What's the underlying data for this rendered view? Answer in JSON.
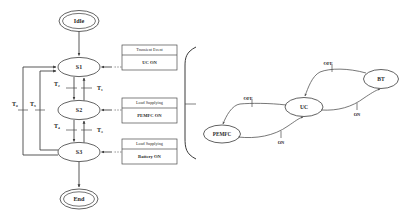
{
  "figure": {
    "colors": {
      "stroke": "#3a3a3a",
      "text": "#2b2b2b",
      "background": "#ffffff"
    }
  },
  "left_diagram": {
    "name": "state-machine",
    "nodes": {
      "idle": "Idle",
      "s1": "S1",
      "s2": "S2",
      "s3": "S3",
      "end": "End"
    },
    "transitions": {
      "t1": "T₁",
      "t2": "T₂",
      "t3a": "T₃",
      "t3b": "T₃",
      "t4": "T₄",
      "t5": "T₅",
      "t6": "T₆"
    },
    "annotation_boxes": [
      {
        "title": "Transient Event",
        "body": "UC ON"
      },
      {
        "title": "Load Supplying",
        "body": "PEMFC ON"
      },
      {
        "title": "Load Supplying",
        "body": "Battery ON"
      }
    ]
  },
  "right_diagram": {
    "name": "source-transition-graph",
    "nodes": {
      "pemfc": "PEMFC",
      "uc": "UC",
      "bt": "BT"
    },
    "edge_labels": {
      "pemfc_to_uc": "OFF",
      "uc_to_bt": "OFF",
      "bt_to_uc": "ON",
      "uc_to_pemfc": "ON"
    }
  }
}
